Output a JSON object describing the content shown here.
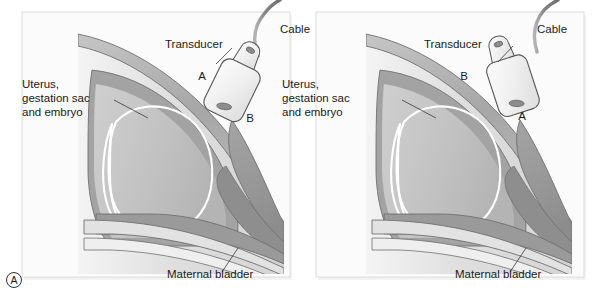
{
  "figure": {
    "panel_letter": "A",
    "background_color": "#ffffff",
    "panel_fill": "#f7f7f7",
    "panel_border_color": "#d8d8d8",
    "width": 608,
    "height": 300
  },
  "colors": {
    "skin_band": "#a8a8a8",
    "subcutaneous": "#d9d9d9",
    "uterus_wall": "#9d9d9d",
    "uterus_body": "#c3c3c3",
    "bladder": "#9a9a9a",
    "bladder_dark": "#8e8e8e",
    "gestation_outline": "#ffffff",
    "outline_stroke": "#6f6f6f",
    "transducer_fill": "#f2f2f2",
    "transducer_stroke": "#555555",
    "cable": "#8a8a8a",
    "text": "#1a1a1a",
    "leader_line": "#3a3a3a"
  },
  "panels": [
    {
      "name": "left-panel",
      "orientation": "sagittal-scan-orientation-1",
      "labels": {
        "cable": "Cable",
        "transducer": "Transducer",
        "uterus": "Uterus,\ngestation sac\nand embryo",
        "uterus_line1": "Uterus,",
        "uterus_line2": "gestation sac",
        "uterus_line3": "and embryo",
        "bladder": "Maternal bladder",
        "marker_a": "A",
        "marker_b": "B"
      },
      "marker_a_position": "upper-left",
      "marker_b_position": "lower-right"
    },
    {
      "name": "right-panel",
      "orientation": "sagittal-scan-orientation-2-rotated",
      "labels": {
        "cable": "Cable",
        "transducer": "Transducer",
        "uterus": "Uterus,\ngestation sac\nand embryo",
        "uterus_line1": "Uterus,",
        "uterus_line2": "gestation sac",
        "uterus_line3": "and embryo",
        "bladder": "Maternal bladder",
        "marker_a": "A",
        "marker_b": "B"
      },
      "marker_a_position": "lower-right",
      "marker_b_position": "upper-left"
    }
  ]
}
